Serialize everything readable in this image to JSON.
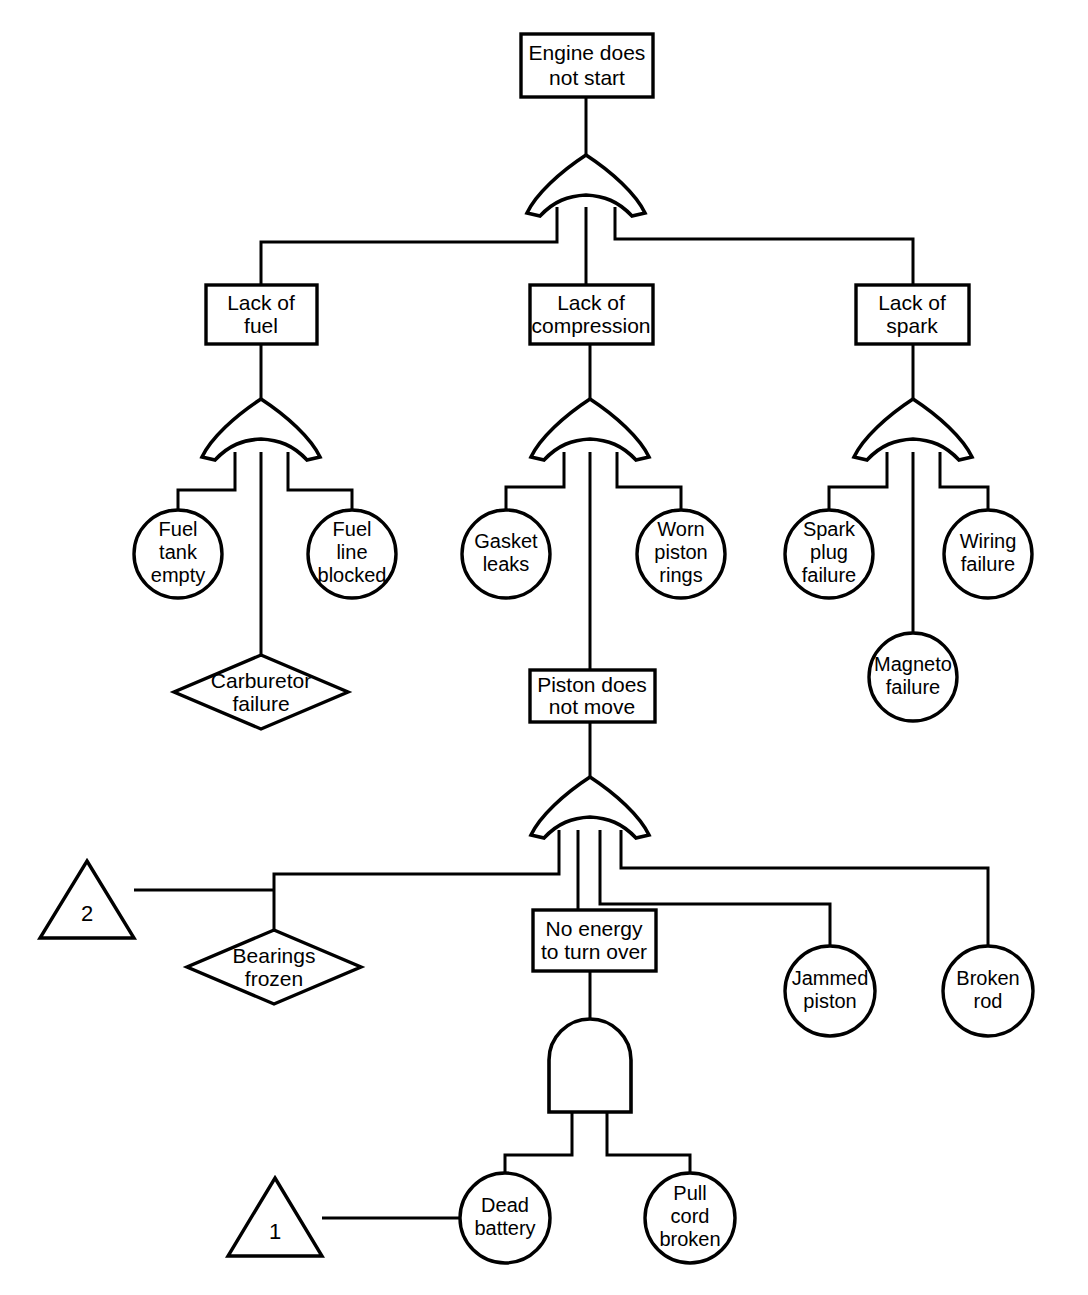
{
  "diagram": {
    "type": "fault-tree",
    "colors": {
      "stroke": "#000000",
      "fill": "#ffffff",
      "text": "#000000"
    },
    "nodes": [
      {
        "id": "top",
        "shape": "rect",
        "label": "Engine does\nnot start"
      },
      {
        "id": "lack_fuel",
        "shape": "rect",
        "label": "Lack of\nfuel"
      },
      {
        "id": "lack_comp",
        "shape": "rect",
        "label": "Lack of\ncompression"
      },
      {
        "id": "lack_spark",
        "shape": "rect",
        "label": "Lack of\nspark"
      },
      {
        "id": "fuel_tank",
        "shape": "circle",
        "label": "Fuel\ntank\nempty"
      },
      {
        "id": "fuel_line",
        "shape": "circle",
        "label": "Fuel\nline\nblocked"
      },
      {
        "id": "carburetor",
        "shape": "diamond",
        "label": "Carburetor\nfailure"
      },
      {
        "id": "gasket",
        "shape": "circle",
        "label": "Gasket\nleaks"
      },
      {
        "id": "worn_rings",
        "shape": "circle",
        "label": "Worn\npiston\nrings"
      },
      {
        "id": "piston_move",
        "shape": "rect",
        "label": "Piston does\nnot move"
      },
      {
        "id": "spark_plug",
        "shape": "circle",
        "label": "Spark\nplug\nfailure"
      },
      {
        "id": "magneto",
        "shape": "circle",
        "label": "Magneto\nfailure"
      },
      {
        "id": "wiring",
        "shape": "circle",
        "label": "Wiring\nfailure"
      },
      {
        "id": "bearings",
        "shape": "diamond",
        "label": "Bearings\nfrozen"
      },
      {
        "id": "no_energy",
        "shape": "rect",
        "label": "No energy\nto turn over"
      },
      {
        "id": "jammed",
        "shape": "circle",
        "label": "Jammed\npiston"
      },
      {
        "id": "broken_rod",
        "shape": "circle",
        "label": "Broken\nrod"
      },
      {
        "id": "dead_battery",
        "shape": "circle",
        "label": "Dead\nbattery"
      },
      {
        "id": "pull_cord",
        "shape": "circle",
        "label": "Pull\ncord\nbroken"
      },
      {
        "id": "transfer_2",
        "shape": "triangle",
        "label": "2"
      },
      {
        "id": "transfer_1",
        "shape": "triangle",
        "label": "1"
      }
    ],
    "gates": [
      {
        "id": "g_top",
        "type": "OR",
        "output": "top",
        "inputs": [
          "lack_fuel",
          "lack_comp",
          "lack_spark"
        ]
      },
      {
        "id": "g_fuel",
        "type": "OR",
        "output": "lack_fuel",
        "inputs": [
          "fuel_tank",
          "carburetor",
          "fuel_line"
        ]
      },
      {
        "id": "g_comp",
        "type": "OR",
        "output": "lack_comp",
        "inputs": [
          "gasket",
          "piston_move",
          "worn_rings"
        ]
      },
      {
        "id": "g_spark",
        "type": "OR",
        "output": "lack_spark",
        "inputs": [
          "spark_plug",
          "magneto",
          "wiring"
        ]
      },
      {
        "id": "g_piston",
        "type": "OR",
        "output": "piston_move",
        "inputs": [
          "bearings",
          "no_energy",
          "jammed",
          "broken_rod"
        ]
      },
      {
        "id": "g_energy",
        "type": "AND",
        "output": "no_energy",
        "inputs": [
          "dead_battery",
          "pull_cord"
        ]
      }
    ],
    "transfers": [
      {
        "id": "transfer_2",
        "label": "2",
        "attached_to": "bearings"
      },
      {
        "id": "transfer_1",
        "label": "1",
        "attached_to": "dead_battery"
      }
    ]
  },
  "labels": {
    "top": [
      "Engine does",
      "not start"
    ],
    "lack_fuel": [
      "Lack of",
      "fuel"
    ],
    "lack_comp": [
      "Lack of",
      "compression"
    ],
    "lack_spark": [
      "Lack of",
      "spark"
    ],
    "fuel_tank": [
      "Fuel",
      "tank",
      "empty"
    ],
    "fuel_line": [
      "Fuel",
      "line",
      "blocked"
    ],
    "carburetor": [
      "Carburetor",
      "failure"
    ],
    "gasket": [
      "Gasket",
      "leaks"
    ],
    "worn_rings": [
      "Worn",
      "piston",
      "rings"
    ],
    "piston_move": [
      "Piston does",
      "not move"
    ],
    "spark_plug": [
      "Spark",
      "plug",
      "failure"
    ],
    "magneto": [
      "Magneto",
      "failure"
    ],
    "wiring": [
      "Wiring",
      "failure"
    ],
    "bearings": [
      "Bearings",
      "frozen"
    ],
    "no_energy": [
      "No energy",
      "to turn over"
    ],
    "jammed": [
      "Jammed",
      "piston"
    ],
    "broken_rod": [
      "Broken",
      "rod"
    ],
    "dead_battery": [
      "Dead",
      "battery"
    ],
    "pull_cord": [
      "Pull",
      "cord",
      "broken"
    ],
    "transfer_2": [
      "2"
    ],
    "transfer_1": [
      "1"
    ]
  }
}
